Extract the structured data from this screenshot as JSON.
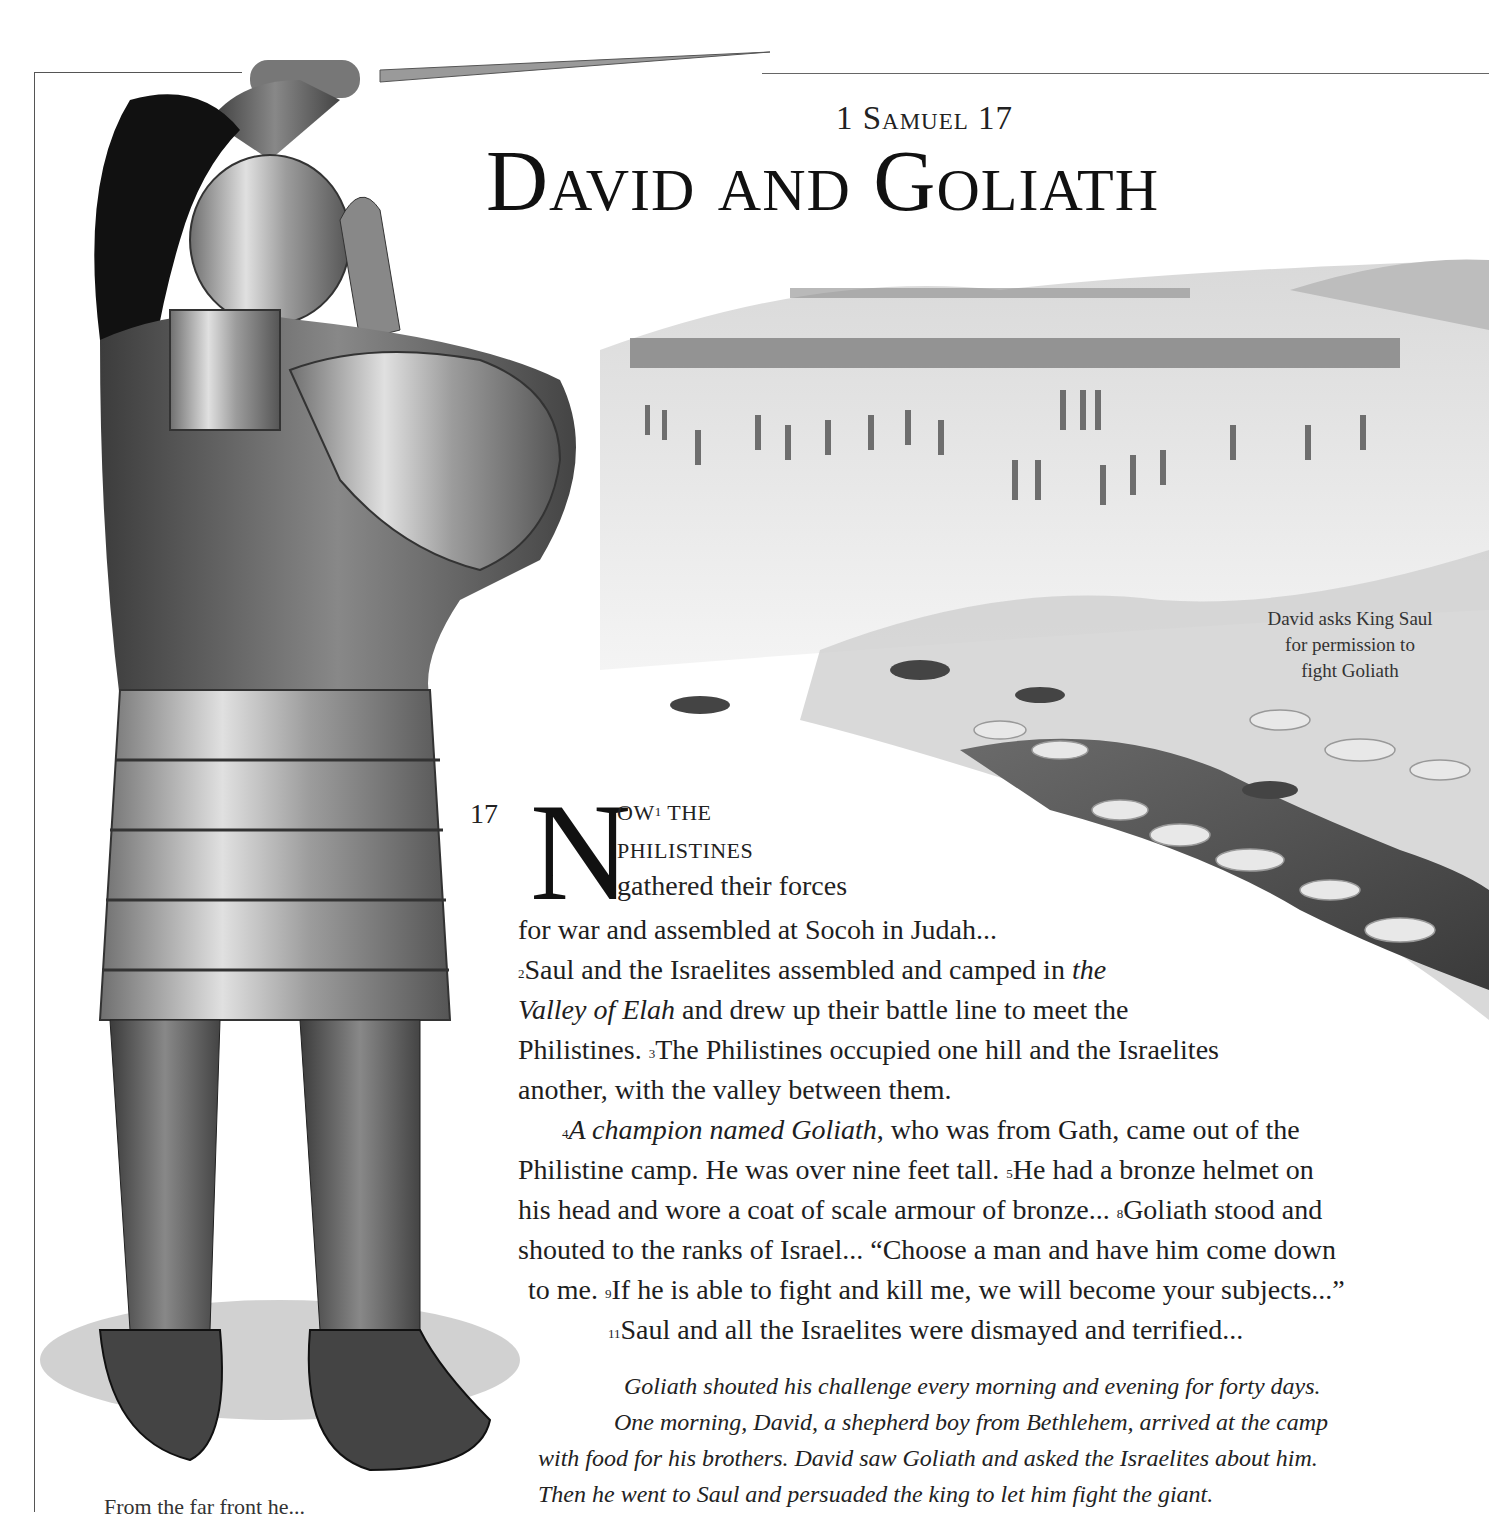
{
  "header": {
    "reference": "1 Samuel 17",
    "title": "David and Goliath"
  },
  "captions": {
    "landscape": [
      "David asks King Saul",
      "for permission to",
      "fight Goliath"
    ],
    "bottom_left_partial": "From the far front he..."
  },
  "scripture": {
    "chapter_number": "17",
    "dropcap": "N",
    "lead_line_1": "OW",
    "lead_line_1_sup": "1",
    "lead_line_1_rest": " THE",
    "lead_line_2": "PHILISTINES",
    "lead_line_3": "gathered their forces",
    "line_4": "for war and assembled at Socoh in Judah...",
    "v2_sup": "2",
    "v2_a": "Saul and the Israelites assembled and camped in ",
    "v2_italic_a": "the",
    "v2_italic_b": "Valley of Elah",
    "v2_b": " and drew up their battle line to meet the",
    "v2_c": "Philistines. ",
    "v3_sup": "3",
    "v3_a": "The Philistines occupied one hill and the Israelites",
    "v3_b": "another, with the valley between them.",
    "v4_sup": "4",
    "v4_italic": "A champion named Goliath",
    "v4_a": ", who was from Gath, came out of the",
    "v4_b": "Philistine camp. He was over nine feet tall. ",
    "v5_sup": "5",
    "v5_a": "He had a bronze helmet on",
    "v5_b": "his head and wore a coat of scale armour of bronze... ",
    "v8_sup": "8",
    "v8_a": "Goliath stood and",
    "v8_b": "shouted to the ranks of Israel... “Choose a man and have him come down",
    "v8_c": "to me. ",
    "v9_sup": "9",
    "v9_a": "If he is able to fight and kill me, we will become your subjects...”",
    "v11_sup": "11",
    "v11_a": "Saul and all the Israelites were dismayed and terrified..."
  },
  "summary": {
    "lines": [
      "Goliath shouted his challenge every morning and evening for forty days.",
      "One morning, David, a shepherd boy from Bethlehem, arrived at the camp",
      "with food for his brothers. David saw Goliath and asked the Israelites about him.",
      "Then he went to Saul and persuaded the king to let him fight the giant."
    ]
  },
  "illustrations": {
    "main": "goliath-armoured-warrior",
    "background": "valley-of-elah-armies-landscape"
  }
}
